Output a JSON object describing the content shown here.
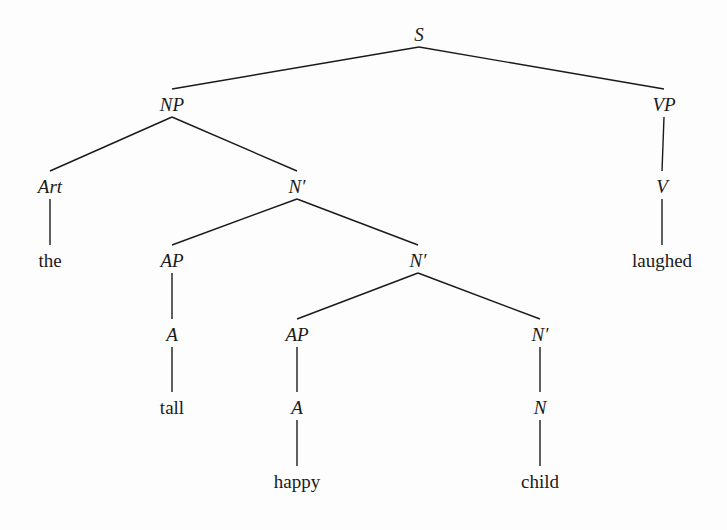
{
  "diagram": {
    "type": "syntax-tree",
    "sentence": "the tall happy child laughed",
    "nodes": [
      {
        "id": "S",
        "label": "S",
        "kind": "category",
        "x": 419,
        "y": 37
      },
      {
        "id": "NP",
        "label": "NP",
        "kind": "category",
        "x": 172,
        "y": 107
      },
      {
        "id": "VP",
        "label": "VP",
        "kind": "category",
        "x": 664,
        "y": 107
      },
      {
        "id": "Art",
        "label": "Art",
        "kind": "category",
        "x": 50,
        "y": 189
      },
      {
        "id": "Nb1",
        "label": "N′",
        "kind": "category",
        "x": 297,
        "y": 189
      },
      {
        "id": "V",
        "label": "V",
        "kind": "category",
        "x": 662,
        "y": 189
      },
      {
        "id": "the",
        "label": "the",
        "kind": "word",
        "x": 50,
        "y": 263
      },
      {
        "id": "AP1",
        "label": "AP",
        "kind": "category",
        "x": 172,
        "y": 263
      },
      {
        "id": "Nb2",
        "label": "N′",
        "kind": "category",
        "x": 418,
        "y": 263
      },
      {
        "id": "laughed",
        "label": "laughed",
        "kind": "word",
        "x": 662,
        "y": 263
      },
      {
        "id": "A1",
        "label": "A",
        "kind": "category",
        "x": 172,
        "y": 337
      },
      {
        "id": "AP2",
        "label": "AP",
        "kind": "category",
        "x": 297,
        "y": 337
      },
      {
        "id": "Nb3",
        "label": "N′",
        "kind": "category",
        "x": 540,
        "y": 337
      },
      {
        "id": "tall",
        "label": "tall",
        "kind": "word",
        "x": 172,
        "y": 410
      },
      {
        "id": "A2",
        "label": "A",
        "kind": "category",
        "x": 297,
        "y": 410
      },
      {
        "id": "N",
        "label": "N",
        "kind": "category",
        "x": 540,
        "y": 410
      },
      {
        "id": "happy",
        "label": "happy",
        "kind": "word",
        "x": 297,
        "y": 484
      },
      {
        "id": "child",
        "label": "child",
        "kind": "word",
        "x": 540,
        "y": 484
      }
    ],
    "edges": [
      [
        "S",
        "NP"
      ],
      [
        "S",
        "VP"
      ],
      [
        "NP",
        "Art"
      ],
      [
        "NP",
        "Nb1"
      ],
      [
        "VP",
        "V"
      ],
      [
        "Art",
        "the"
      ],
      [
        "Nb1",
        "AP1"
      ],
      [
        "Nb1",
        "Nb2"
      ],
      [
        "V",
        "laughed"
      ],
      [
        "AP1",
        "A1"
      ],
      [
        "Nb2",
        "AP2"
      ],
      [
        "Nb2",
        "Nb3"
      ],
      [
        "A1",
        "tall"
      ],
      [
        "AP2",
        "A2"
      ],
      [
        "Nb3",
        "N"
      ],
      [
        "A2",
        "happy"
      ],
      [
        "N",
        "child"
      ]
    ]
  }
}
